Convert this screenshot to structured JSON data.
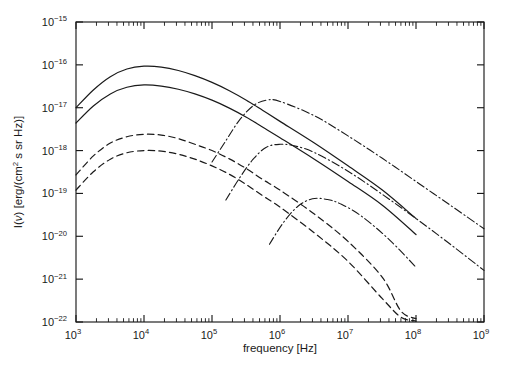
{
  "figure": {
    "name": "radio-spectrum-plot",
    "background": "#ffffff",
    "foreground": "#1a1a1a"
  },
  "axes": {
    "x_title": "frequency [Hz]",
    "y_title_prefix": "I(",
    "y_title_nu": "ν",
    "y_title_suffix": ") [erg/(cm",
    "y_title_sup": "2",
    "y_title_tail": " s sr Hz)]",
    "x_tick_labels": [
      "10",
      "10",
      "10",
      "10",
      "10",
      "10",
      "10"
    ],
    "x_tick_exponents": [
      "3",
      "4",
      "5",
      "6",
      "7",
      "8",
      "9"
    ],
    "y_tick_labels": [
      "10",
      "10",
      "10",
      "10",
      "10",
      "10",
      "10",
      "10"
    ],
    "y_tick_exponents": [
      "−15",
      "−16",
      "−17",
      "−18",
      "−19",
      "−20",
      "−21",
      "−22"
    ]
  },
  "chart_data": {
    "type": "line",
    "title": "",
    "xlabel": "frequency [Hz]",
    "ylabel": "I(ν) [erg/(cm2 s sr Hz)]",
    "xscale": "log",
    "yscale": "log",
    "xlim": [
      1000,
      1000000000
    ],
    "ylim": [
      1e-22,
      1e-15
    ],
    "grid": false,
    "legend": "none",
    "xticks": [
      1000,
      10000,
      100000,
      1000000,
      10000000,
      100000000,
      1000000000
    ],
    "yticks": [
      1e-22,
      1e-21,
      1e-20,
      1e-19,
      1e-18,
      1e-17,
      1e-16,
      1e-15
    ],
    "series": [
      {
        "name": "solid-upper",
        "style": "solid",
        "x": [
          1000,
          1800,
          3200,
          5600,
          10000,
          18000,
          32000,
          56000,
          100000,
          180000,
          320000,
          560000,
          1000000,
          3200000,
          10000000,
          32000000,
          100000000
        ],
        "y": [
          1e-17,
          2.6e-17,
          5.3e-17,
          8e-17,
          9.3e-17,
          8.9e-17,
          7.4e-17,
          5.6e-17,
          3.9e-17,
          2.5e-17,
          1.5e-17,
          8.6e-18,
          4.8e-18,
          1.5e-18,
          4.4e-19,
          1.2e-19,
          2.6e-20
        ]
      },
      {
        "name": "solid-lower",
        "style": "solid",
        "x": [
          1000,
          1800,
          3200,
          5600,
          10000,
          18000,
          32000,
          56000,
          100000,
          180000,
          320000,
          560000,
          1000000,
          3200000,
          10000000,
          32000000,
          100000000
        ],
        "y": [
          4.4e-18,
          1.1e-17,
          2.1e-17,
          3e-17,
          3.4e-17,
          3.2e-17,
          2.7e-17,
          2.1e-17,
          1.5e-17,
          9.8e-18,
          6e-18,
          3.5e-18,
          2e-18,
          6.3e-19,
          1.9e-19,
          5.3e-20,
          1.1e-20
        ]
      },
      {
        "name": "dashed-upper",
        "style": "dashed",
        "x": [
          1000,
          1800,
          3200,
          5600,
          10000,
          18000,
          32000,
          56000,
          100000,
          180000,
          320000,
          560000,
          1000000,
          3200000,
          10000000,
          32000000,
          60000000,
          100000000
        ],
        "y": [
          2.7e-19,
          7.5e-19,
          1.5e-18,
          2.1e-18,
          2.4e-18,
          2.3e-18,
          1.9e-18,
          1.4e-18,
          1e-18,
          6.4e-19,
          3.8e-19,
          2.1e-19,
          1.2e-19,
          3.3e-20,
          7.6e-21,
          1.1e-21,
          1.8e-22,
          1.2e-22
        ]
      },
      {
        "name": "dashed-lower",
        "style": "dashed",
        "x": [
          1000,
          1800,
          3200,
          5600,
          10000,
          18000,
          32000,
          56000,
          100000,
          180000,
          320000,
          560000,
          1000000,
          3200000,
          10000000,
          32000000,
          60000000,
          100000000
        ],
        "y": [
          1.2e-19,
          3.2e-19,
          6.3e-19,
          8.9e-19,
          1e-18,
          9.7e-19,
          8.2e-19,
          6.3e-19,
          4.4e-19,
          2.8e-19,
          1.6e-19,
          8.8e-20,
          4.8e-20,
          1.2e-20,
          2.6e-21,
          3.5e-22,
          1.3e-22,
          1.05e-22
        ]
      },
      {
        "name": "dashdot-upper",
        "style": "dashdot",
        "x": [
          100000,
          160000,
          250000,
          400000,
          630000,
          1000000,
          3200000,
          10000000,
          32000000,
          100000000,
          320000000,
          1000000000
        ],
        "y": [
          5.4e-19,
          1.7e-18,
          5e-18,
          1.1e-17,
          1.5e-17,
          1.4e-17,
          6.5e-18,
          2.2e-18,
          6.6e-19,
          1.9e-19,
          5.3e-20,
          1.5e-20
        ]
      },
      {
        "name": "dashdot-middle",
        "style": "dashdot",
        "x": [
          160000,
          250000,
          400000,
          630000,
          1000000,
          1600000,
          3200000,
          10000000,
          32000000,
          100000000,
          320000000,
          1000000000
        ],
        "y": [
          7e-20,
          2.2e-19,
          6.2e-19,
          1.2e-18,
          1.4e-18,
          1.3e-18,
          9e-19,
          3.3e-19,
          9.5e-20,
          2.6e-20,
          6.5e-21,
          1.6e-21
        ]
      },
      {
        "name": "dashdot-lower",
        "style": "dashdot",
        "x": [
          700000,
          1100000,
          1800000,
          3000000,
          5000000,
          8000000,
          16000000,
          40000000,
          100000000
        ],
        "y": [
          6.5e-21,
          2e-20,
          4.9e-20,
          7.5e-20,
          7.2e-20,
          5.6e-20,
          2.9e-20,
          8.5e-21,
          1.9e-21
        ]
      }
    ]
  }
}
